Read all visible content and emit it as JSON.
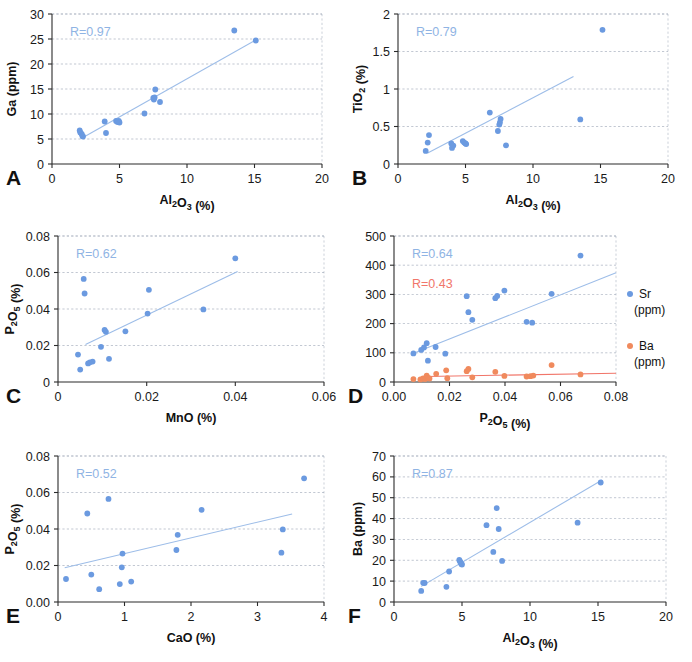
{
  "figure": {
    "background": "#ffffff",
    "marker_blue": "#6b9ae0",
    "marker_orange": "#f08a5d",
    "trend_blue": "#9dbde8",
    "trend_orange": "#f1766a",
    "rlabel_blue": "#8fb4e4",
    "rlabel_red": "#f1766a",
    "grid_color": "#9aa4b5",
    "axis_color": "#2b2b2b"
  },
  "panels": [
    {
      "letter": "A",
      "rlabel": "R=0.97",
      "rlabel_color": "#8fb4e4",
      "chart_data": {
        "type": "scatter",
        "title": "",
        "xlabel": "Al2O3 (%)",
        "xlabel_parts": [
          "Al",
          "2",
          "O",
          "3",
          " (%)"
        ],
        "ylabel": "Ga (ppm)",
        "xlim": [
          0,
          20
        ],
        "ylim": [
          0,
          30
        ],
        "xticks": [
          "0",
          "5",
          "10",
          "15",
          "20"
        ],
        "xtickvals": [
          0,
          5,
          10,
          15,
          20
        ],
        "yticks": [
          "0",
          "5",
          "10",
          "15",
          "20",
          "25",
          "30"
        ],
        "ytickvals": [
          0,
          5,
          10,
          15,
          20,
          25,
          30
        ],
        "grid": true,
        "legend": null,
        "series": [
          {
            "name": "Ga",
            "color": "#6b9ae0",
            "points": [
              [
                2.05,
                6.7
              ],
              [
                2.1,
                6.3
              ],
              [
                2.2,
                6.0
              ],
              [
                2.25,
                5.6
              ],
              [
                2.3,
                5.5
              ],
              [
                3.9,
                8.5
              ],
              [
                4.0,
                6.2
              ],
              [
                4.75,
                8.6
              ],
              [
                4.85,
                8.4
              ],
              [
                4.95,
                8.6
              ],
              [
                5.0,
                8.3
              ],
              [
                6.85,
                10.1
              ],
              [
                7.5,
                13.2
              ],
              [
                7.55,
                12.9
              ],
              [
                7.6,
                13.3
              ],
              [
                7.65,
                14.9
              ],
              [
                8.0,
                12.4
              ],
              [
                13.5,
                26.7
              ],
              [
                15.1,
                24.7
              ]
            ],
            "trend": {
              "x0": 2.3,
              "y0": 5.3,
              "x1": 15.1,
              "y1": 24.8
            }
          }
        ]
      }
    },
    {
      "letter": "B",
      "rlabel": "R=0.79",
      "rlabel_color": "#8fb4e4",
      "chart_data": {
        "type": "scatter",
        "title": "",
        "xlabel": "Al2O3 (%)",
        "xlabel_parts": [
          "Al",
          "2",
          "O",
          "3",
          " (%)"
        ],
        "ylabel": "TiO2 (%)",
        "ylabel_parts": [
          "TiO",
          "2",
          " (%)"
        ],
        "xlim": [
          0,
          20
        ],
        "ylim": [
          0,
          2
        ],
        "xticks": [
          "0",
          "5",
          "10",
          "15",
          "20"
        ],
        "xtickvals": [
          0,
          5,
          10,
          15,
          20
        ],
        "yticks": [
          "0",
          "0.5",
          "1",
          "1.5",
          "2"
        ],
        "ytickvals": [
          0,
          0.5,
          1,
          1.5,
          2
        ],
        "grid": true,
        "legend": null,
        "series": [
          {
            "name": "TiO2",
            "color": "#6b9ae0",
            "points": [
              [
                2.05,
                0.175
              ],
              [
                2.2,
                0.285
              ],
              [
                2.3,
                0.385
              ],
              [
                3.95,
                0.275
              ],
              [
                4.0,
                0.215
              ],
              [
                4.1,
                0.245
              ],
              [
                4.8,
                0.305
              ],
              [
                4.9,
                0.285
              ],
              [
                5.0,
                0.275
              ],
              [
                5.05,
                0.265
              ],
              [
                6.8,
                0.685
              ],
              [
                7.4,
                0.44
              ],
              [
                7.5,
                0.525
              ],
              [
                7.55,
                0.555
              ],
              [
                7.6,
                0.6
              ],
              [
                8.0,
                0.25
              ],
              [
                13.5,
                0.595
              ],
              [
                15.15,
                1.79
              ]
            ],
            "trend": {
              "x0": 2.2,
              "y0": 0.145,
              "x1": 13.0,
              "y1": 1.165
            }
          }
        ]
      }
    },
    {
      "letter": "C",
      "rlabel": "R=0.62",
      "rlabel_color": "#8fb4e4",
      "chart_data": {
        "type": "scatter",
        "title": "",
        "xlabel": "MnO (%)",
        "ylabel": "P2O5 (%)",
        "ylabel_parts": [
          "P",
          "2",
          "O",
          "5",
          " (%)"
        ],
        "xlim": [
          0,
          0.06
        ],
        "ylim": [
          0,
          0.08
        ],
        "xticks": [
          "0",
          "0.02",
          "0.04",
          "0.06"
        ],
        "xtickvals": [
          0,
          0.02,
          0.04,
          0.06
        ],
        "yticks": [
          "0",
          "0.02",
          "0.04",
          "0.06",
          "0.08"
        ],
        "ytickvals": [
          0,
          0.02,
          0.04,
          0.06,
          0.08
        ],
        "grid": true,
        "legend": null,
        "series": [
          {
            "name": "P2O5",
            "color": "#6b9ae0",
            "points": [
              [
                0.0045,
                0.015
              ],
              [
                0.005,
                0.0068
              ],
              [
                0.0058,
                0.0565
              ],
              [
                0.006,
                0.0485
              ],
              [
                0.0068,
                0.0102
              ],
              [
                0.0072,
                0.0108
              ],
              [
                0.0078,
                0.0112
              ],
              [
                0.0097,
                0.0193
              ],
              [
                0.0105,
                0.0285
              ],
              [
                0.0108,
                0.0275
              ],
              [
                0.0115,
                0.0127
              ],
              [
                0.0152,
                0.0278
              ],
              [
                0.0202,
                0.0375
              ],
              [
                0.0205,
                0.0505
              ],
              [
                0.0328,
                0.0398
              ],
              [
                0.04,
                0.0678
              ]
            ],
            "trend": {
              "x0": 0.0062,
              "y0": 0.0205,
              "x1": 0.0405,
              "y1": 0.0605
            }
          }
        ]
      }
    },
    {
      "letter": "D",
      "rlabel": "R=0.64",
      "rlabel_color": "#8fb4e4",
      "rlabel2": "R=0.43",
      "rlabel2_color": "#f1766a",
      "chart_data": {
        "type": "scatter",
        "title": "",
        "xlabel": "P2O5 (%)",
        "xlabel_parts": [
          "P",
          "2",
          "O",
          "5",
          " (%)"
        ],
        "ylabel": "",
        "xlim": [
          0,
          0.08
        ],
        "ylim": [
          0,
          500
        ],
        "xticks": [
          "0.00",
          "0.02",
          "0.04",
          "0.06",
          "0.08"
        ],
        "xtickvals": [
          0,
          0.02,
          0.04,
          0.06,
          0.08
        ],
        "yticks": [
          "0",
          "100",
          "200",
          "300",
          "400",
          "500"
        ],
        "ytickvals": [
          0,
          100,
          200,
          300,
          400,
          500
        ],
        "grid": true,
        "legend": {
          "position": "right",
          "entries": [
            {
              "label_line1": "Sr",
              "label_line2": "(ppm)",
              "color": "#6b9ae0"
            },
            {
              "label_line1": "Ba",
              "label_line2": "(ppm)",
              "color": "#f08a5d"
            }
          ]
        },
        "series": [
          {
            "name": "Sr",
            "color": "#6b9ae0",
            "points": [
              [
                0.007,
                98
              ],
              [
                0.0098,
                110
              ],
              [
                0.0108,
                118
              ],
              [
                0.0118,
                133
              ],
              [
                0.0122,
                73
              ],
              [
                0.015,
                120
              ],
              [
                0.0185,
                97
              ],
              [
                0.0262,
                294
              ],
              [
                0.0268,
                239
              ],
              [
                0.0282,
                213
              ],
              [
                0.0365,
                287
              ],
              [
                0.0372,
                295
              ],
              [
                0.0398,
                313
              ],
              [
                0.0478,
                206
              ],
              [
                0.0498,
                203
              ],
              [
                0.0568,
                302
              ],
              [
                0.0672,
                433
              ]
            ],
            "trend": {
              "x0": 0.0075,
              "y0": 100,
              "x1": 0.08,
              "y1": 374
            }
          },
          {
            "name": "Ba",
            "color": "#f08a5d",
            "points": [
              [
                0.007,
                10
              ],
              [
                0.0095,
                9
              ],
              [
                0.0105,
                12
              ],
              [
                0.0112,
                10
              ],
              [
                0.0118,
                22
              ],
              [
                0.0122,
                14
              ],
              [
                0.0128,
                12
              ],
              [
                0.0152,
                28
              ],
              [
                0.0188,
                40
              ],
              [
                0.0192,
                13
              ],
              [
                0.0262,
                37
              ],
              [
                0.0268,
                45
              ],
              [
                0.0282,
                16
              ],
              [
                0.0365,
                35
              ],
              [
                0.0398,
                21
              ],
              [
                0.0478,
                19
              ],
              [
                0.0492,
                20
              ],
              [
                0.0502,
                22
              ],
              [
                0.0568,
                58
              ],
              [
                0.0672,
                26
              ]
            ],
            "trend": {
              "x0": 0.0118,
              "y0": 19,
              "x1": 0.08,
              "y1": 30
            }
          }
        ]
      }
    },
    {
      "letter": "E",
      "rlabel": "R=0.52",
      "rlabel_color": "#8fb4e4",
      "chart_data": {
        "type": "scatter",
        "title": "",
        "xlabel": "CaO (%)",
        "ylabel": "P2O5 (%)",
        "ylabel_parts": [
          "P",
          "2",
          "O",
          "5",
          " (%)"
        ],
        "xlim": [
          0,
          4
        ],
        "ylim": [
          0,
          0.08
        ],
        "xticks": [
          "0",
          "1",
          "2",
          "3",
          "4"
        ],
        "xtickvals": [
          0,
          1,
          2,
          3,
          4
        ],
        "yticks": [
          "0.00",
          "0.02",
          "0.04",
          "0.06",
          "0.08"
        ],
        "ytickvals": [
          0,
          0.02,
          0.04,
          0.06,
          0.08
        ],
        "grid": true,
        "legend": null,
        "series": [
          {
            "name": "P2O5",
            "color": "#6b9ae0",
            "points": [
              [
                0.12,
                0.0126
              ],
              [
                0.44,
                0.0485
              ],
              [
                0.5,
                0.015
              ],
              [
                0.62,
                0.007
              ],
              [
                0.76,
                0.0565
              ],
              [
                0.93,
                0.0098
              ],
              [
                0.96,
                0.019
              ],
              [
                0.97,
                0.0265
              ],
              [
                1.1,
                0.0112
              ],
              [
                1.78,
                0.0285
              ],
              [
                1.8,
                0.0368
              ],
              [
                2.16,
                0.0505
              ],
              [
                3.36,
                0.027
              ],
              [
                3.38,
                0.0398
              ],
              [
                3.7,
                0.0678
              ]
            ],
            "trend": {
              "x0": 0.1,
              "y0": 0.0188,
              "x1": 3.52,
              "y1": 0.0482
            }
          }
        ]
      }
    },
    {
      "letter": "F",
      "rlabel": "R=0.87",
      "rlabel_color": "#8fb4e4",
      "chart_data": {
        "type": "scatter",
        "title": "",
        "xlabel": "Al2O3 (%)",
        "xlabel_parts": [
          "Al",
          "2",
          "O",
          "3",
          " (%)"
        ],
        "ylabel": "Ba (ppm)",
        "xlim": [
          0,
          20
        ],
        "ylim": [
          0,
          70
        ],
        "xticks": [
          "0",
          "5",
          "10",
          "15",
          "20"
        ],
        "xtickvals": [
          0,
          5,
          10,
          15,
          20
        ],
        "yticks": [
          "0",
          "10",
          "20",
          "30",
          "40",
          "50",
          "60",
          "70"
        ],
        "ytickvals": [
          0,
          10,
          20,
          30,
          40,
          50,
          60,
          70
        ],
        "grid": true,
        "legend": null,
        "series": [
          {
            "name": "Ba",
            "color": "#6b9ae0",
            "points": [
              [
                2.0,
                5.3
              ],
              [
                2.15,
                9.2
              ],
              [
                2.25,
                9.1
              ],
              [
                3.85,
                7.3
              ],
              [
                4.05,
                14.6
              ],
              [
                4.8,
                20.2
              ],
              [
                4.85,
                19.5
              ],
              [
                4.9,
                19.0
              ],
              [
                4.95,
                18.2
              ],
              [
                5.0,
                18.0
              ],
              [
                6.8,
                36.8
              ],
              [
                7.3,
                24.0
              ],
              [
                7.55,
                45.0
              ],
              [
                7.7,
                35.0
              ],
              [
                7.95,
                19.7
              ],
              [
                13.5,
                38.0
              ],
              [
                15.2,
                57.3
              ]
            ],
            "trend": {
              "x0": 2.0,
              "y0": 7.5,
              "x1": 15.3,
              "y1": 58.5
            }
          }
        ]
      }
    }
  ]
}
